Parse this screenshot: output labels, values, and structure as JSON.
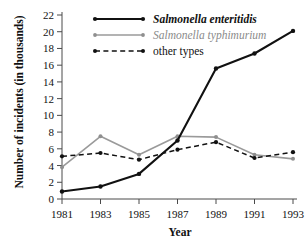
{
  "chart_data": {
    "type": "line",
    "title": "",
    "xlabel": "Year",
    "ylabel": "Number of incidents (in thousands)",
    "x": [
      1981,
      1983,
      1985,
      1987,
      1989,
      1991,
      1993
    ],
    "xtick_labels": [
      "1981",
      "1983",
      "1985",
      "1987",
      "1989",
      "1991",
      "1993"
    ],
    "ytick_labels": [
      "0",
      "2",
      "4",
      "6",
      "8",
      "10",
      "12",
      "14",
      "16",
      "18",
      "20",
      "22"
    ],
    "ytick_values": [
      0,
      2,
      4,
      6,
      8,
      10,
      12,
      14,
      16,
      18,
      20,
      22
    ],
    "xlim": [
      1981,
      1993
    ],
    "ylim": [
      0,
      22
    ],
    "grid": false,
    "legend_position": "top-left-inside",
    "series": [
      {
        "name": "Salmonella enteritidis",
        "style": "solid",
        "color": "#111111",
        "marker": "circle",
        "values": [
          0.9,
          1.5,
          3.0,
          7.0,
          15.6,
          17.4,
          20.1
        ]
      },
      {
        "name": "Salmonella typhimurium",
        "style": "solid",
        "color": "#9a9a9a",
        "marker": "circle",
        "values": [
          3.8,
          7.5,
          5.3,
          7.5,
          7.4,
          5.3,
          4.8
        ]
      },
      {
        "name": "other types",
        "style": "dashed",
        "color": "#111111",
        "marker": "circle",
        "values": [
          5.1,
          5.5,
          4.7,
          5.9,
          6.8,
          4.9,
          5.6
        ]
      }
    ]
  },
  "legend": {
    "items": [
      {
        "label": "Salmonella enteritidis"
      },
      {
        "label": "Salmonella typhimurium"
      },
      {
        "label": "other types"
      }
    ]
  }
}
